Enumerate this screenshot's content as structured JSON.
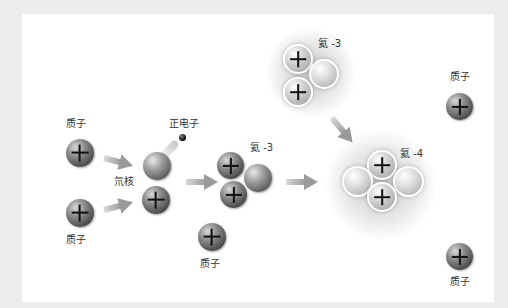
{
  "diagram": {
    "title": "",
    "labels": {
      "proton_top_left": "质子",
      "proton_bottom_left": "质子",
      "deuterium": "氘核",
      "positron": "正电子",
      "helium3_middle": "氦 -3",
      "proton_lower_middle": "质子",
      "helium3_top": "氦 -3",
      "helium4": "氦 -4",
      "proton_top_right": "质子",
      "proton_bottom_right": "质子"
    },
    "particles": [
      {
        "name": "proton",
        "symbol": "+"
      },
      {
        "name": "neutron",
        "symbol": ""
      },
      {
        "name": "positron",
        "symbol": ""
      }
    ],
    "colors": {
      "background": "#ececec",
      "panel": "#ffffff",
      "arrow": "#a8a8a8",
      "label_text": "#333333"
    }
  }
}
